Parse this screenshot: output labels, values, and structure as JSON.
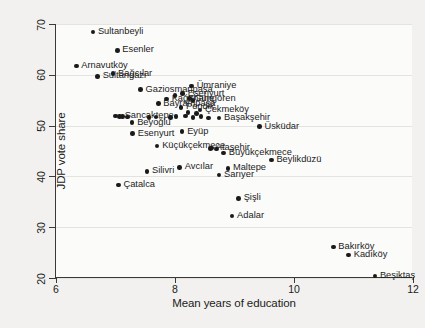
{
  "chart_data": {
    "type": "scatter",
    "title": "",
    "xlabel": "Mean years of education",
    "ylabel": "JDP vote share",
    "xlim": [
      6,
      12
    ],
    "ylim": [
      20,
      70
    ],
    "xticks": [
      6,
      8,
      10,
      12
    ],
    "yticks": [
      20,
      30,
      40,
      50,
      60,
      70
    ],
    "grid": "horizontal",
    "legend": "none",
    "marker_color": "#1a1a1a",
    "points": [
      {
        "label": "Sultanbeyli",
        "x": 6.62,
        "y": 68.4,
        "side": "right"
      },
      {
        "label": "Esenler",
        "x": 7.03,
        "y": 64.8,
        "side": "right"
      },
      {
        "label": "Arnavutköy",
        "x": 6.34,
        "y": 61.7,
        "side": "right"
      },
      {
        "label": "Sultangazi",
        "x": 6.7,
        "y": 59.7,
        "side": "right"
      },
      {
        "label": "Bağcılar",
        "x": 6.96,
        "y": 60.2,
        "side": "right"
      },
      {
        "label": "Gaziosmanpaşa",
        "x": 7.42,
        "y": 57.1,
        "side": "right"
      },
      {
        "label": "Ümraniye",
        "x": 8.28,
        "y": 57.8,
        "side": "right"
      },
      {
        "label": "Esenyurt",
        "x": 8.13,
        "y": 56.3,
        "side": "right"
      },
      {
        "label": "Güngören",
        "x": 8.24,
        "y": 55.3,
        "side": "right"
      },
      {
        "label": "Kağıthane",
        "x": 7.86,
        "y": 55.2,
        "side": "right"
      },
      {
        "label": "Bayrampaşa",
        "x": 7.72,
        "y": 54.3,
        "side": "right"
      },
      {
        "label": "Pendik",
        "x": 8.1,
        "y": 53.6,
        "side": "right"
      },
      {
        "label": "Çekmeköy",
        "x": 8.42,
        "y": 53.1,
        "side": "right"
      },
      {
        "label": "Sancaktepe",
        "x": 7.07,
        "y": 51.8,
        "side": "right"
      },
      {
        "label": "Beyoğlu",
        "x": 7.28,
        "y": 50.6,
        "side": "right"
      },
      {
        "label": "Başakşehir",
        "x": 8.74,
        "y": 51.5,
        "side": "right"
      },
      {
        "label": "Üsküdar",
        "x": 9.42,
        "y": 49.8,
        "side": "right"
      },
      {
        "label": "Esenyurt2",
        "x": 7.29,
        "y": 48.4,
        "side": "right"
      },
      {
        "label": "Eyüp",
        "x": 8.12,
        "y": 48.8,
        "side": "right"
      },
      {
        "label": "Küçükçekmece",
        "x": 7.7,
        "y": 46.0,
        "side": "right"
      },
      {
        "label": "Ataşehir",
        "x": 8.6,
        "y": 45.5,
        "side": "right"
      },
      {
        "label": "Büyükçekmece",
        "x": 8.82,
        "y": 44.6,
        "side": "right"
      },
      {
        "label": "Beylikdüzü",
        "x": 9.62,
        "y": 43.2,
        "side": "right"
      },
      {
        "label": "Avcılar",
        "x": 8.08,
        "y": 41.8,
        "side": "right"
      },
      {
        "label": "Maltepe",
        "x": 8.89,
        "y": 41.6,
        "side": "right"
      },
      {
        "label": "Silivri",
        "x": 7.53,
        "y": 41.0,
        "side": "right"
      },
      {
        "label": "Sarıyer",
        "x": 8.74,
        "y": 40.3,
        "side": "right"
      },
      {
        "label": "Çatalca",
        "x": 7.05,
        "y": 38.3,
        "side": "right"
      },
      {
        "label": "Şişli",
        "x": 9.07,
        "y": 35.7,
        "side": "right"
      },
      {
        "label": "Adalar",
        "x": 8.96,
        "y": 32.2,
        "side": "right"
      },
      {
        "label": "Bakırköy",
        "x": 10.66,
        "y": 26.1,
        "side": "right"
      },
      {
        "label": "Kadıköy",
        "x": 10.92,
        "y": 24.5,
        "side": "right"
      },
      {
        "label": "Beşiktaş",
        "x": 11.36,
        "y": 20.4,
        "side": "right"
      }
    ],
    "hidden_cluster_points": [
      {
        "x": 7.0,
        "y": 51.9
      },
      {
        "x": 7.12,
        "y": 51.8
      },
      {
        "x": 7.2,
        "y": 51.7
      },
      {
        "x": 7.56,
        "y": 51.6
      },
      {
        "x": 7.68,
        "y": 51.7
      },
      {
        "x": 7.92,
        "y": 51.6
      },
      {
        "x": 8.02,
        "y": 51.8
      },
      {
        "x": 8.18,
        "y": 51.9
      },
      {
        "x": 8.3,
        "y": 51.6
      },
      {
        "x": 8.44,
        "y": 51.8
      },
      {
        "x": 8.56,
        "y": 51.5
      },
      {
        "x": 8.22,
        "y": 52.6
      },
      {
        "x": 8.36,
        "y": 52.4
      },
      {
        "x": 8.0,
        "y": 55.9
      },
      {
        "x": 8.3,
        "y": 54.9
      },
      {
        "x": 8.62,
        "y": 45.6
      },
      {
        "x": 8.7,
        "y": 45.4
      }
    ]
  },
  "axes": {
    "x_label": "Mean years of education",
    "y_label": "JDP vote share",
    "x_tick_labels": [
      "6",
      "8",
      "10",
      "12"
    ],
    "y_tick_labels": [
      "20",
      "30",
      "40",
      "50",
      "60",
      "70"
    ]
  }
}
